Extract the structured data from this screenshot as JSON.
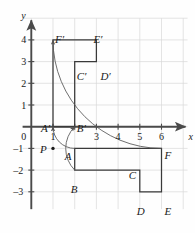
{
  "figure": {
    "colors": {
      "grid": "#d8d8d8",
      "axis": "#4a4a4a",
      "shape": "#3a3a3a",
      "arc": "#555555",
      "text": "#1a1a1a",
      "background": "#fefefe"
    },
    "axes": {
      "x_label": "x",
      "y_label": "y",
      "x_range": [
        -0.4,
        7.2
      ],
      "y_range": [
        -3.8,
        5.0
      ],
      "x_ticks": [
        {
          "value": 1,
          "label": "1"
        },
        {
          "value": 2,
          "label": ""
        },
        {
          "value": 3,
          "label": "3"
        },
        {
          "value": 4,
          "label": "4"
        },
        {
          "value": 5,
          "label": "5"
        },
        {
          "value": 6,
          "label": "6"
        }
      ],
      "y_ticks": [
        {
          "value": 4,
          "label": "4"
        },
        {
          "value": 3,
          "label": "3"
        },
        {
          "value": 2,
          "label": "2"
        },
        {
          "value": 1,
          "label": "1"
        },
        {
          "value": 0,
          "label": "0"
        },
        {
          "value": -1,
          "label": "–1"
        },
        {
          "value": -2,
          "label": "–2"
        },
        {
          "value": -3,
          "label": "–3"
        }
      ],
      "origin_label": "0"
    },
    "center_point": {
      "name": "P",
      "label": "P",
      "x": 1,
      "y": -1,
      "dot": true
    },
    "preimage": {
      "name": "ABCDEF",
      "closed": true,
      "vertices": [
        {
          "label": "A",
          "x": 2,
          "y": -1,
          "label_dx": -10,
          "label_dy": 3
        },
        {
          "label": "B",
          "x": 2,
          "y": -2,
          "label_dx": -4,
          "label_dy": 14
        },
        {
          "label": "C",
          "x": 5,
          "y": -2,
          "label_dx": -11,
          "label_dy": 0
        },
        {
          "label": "D",
          "x": 5,
          "y": -3,
          "label_dx": -3,
          "label_dy": 14
        },
        {
          "label": "E",
          "x": 6,
          "y": -3,
          "label_dx": 3,
          "label_dy": 14
        },
        {
          "label": "F",
          "x": 6,
          "y": -1,
          "label_dx": 3,
          "label_dy": 2
        }
      ]
    },
    "image": {
      "name": "A'B'C'D'E'F'",
      "closed": true,
      "vertices": [
        {
          "label": "A′",
          "x": 1,
          "y": 0,
          "label_dx": -12,
          "label_dy": -4
        },
        {
          "label": "B′",
          "x": 2,
          "y": 0,
          "label_dx": 2,
          "label_dy": -4
        },
        {
          "label": "C′",
          "x": 2,
          "y": 3,
          "label_dx": 2,
          "label_dy": 9
        },
        {
          "label": "D′",
          "x": 3,
          "y": 3,
          "label_dx": 4,
          "label_dy": 9
        },
        {
          "label": "E′",
          "x": 3,
          "y": 4,
          "label_dx": -3,
          "label_dy": -6
        },
        {
          "label": "F′",
          "x": 1,
          "y": 4,
          "label_dx": 2,
          "label_dy": -6
        }
      ]
    },
    "rotation": {
      "degrees": 90,
      "direction": "counterclockwise",
      "arcs": [
        {
          "name": "arc-A-to-A-prime",
          "from_x": 2,
          "from_y": -1,
          "to_x": 1,
          "to_y": 0
        },
        {
          "name": "arc-B-to-B-prime",
          "from_x": 2,
          "from_y": -2,
          "to_x": 2,
          "to_y": 0
        },
        {
          "name": "arc-F-to-F-prime",
          "from_x": 6,
          "from_y": -1,
          "to_x": 1,
          "to_y": 4
        }
      ]
    }
  }
}
